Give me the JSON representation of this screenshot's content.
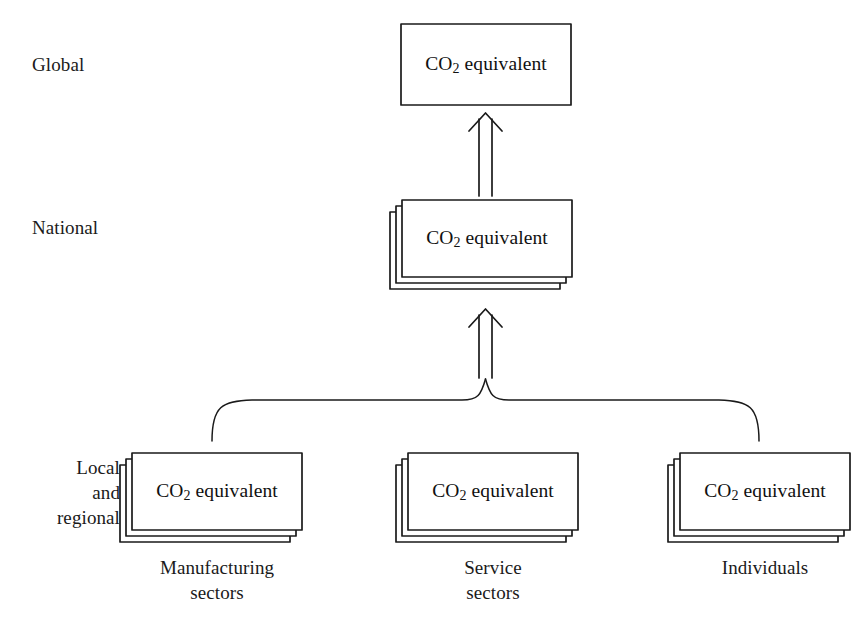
{
  "figure": {
    "kind": "hierarchy-diagram",
    "background_color": "#ffffff",
    "line_color": "#1a1a1a"
  },
  "tiers": [
    {
      "id": "global",
      "label": "Global"
    },
    {
      "id": "national",
      "label": "National"
    },
    {
      "id": "local",
      "label": "Local\nand\nregional"
    }
  ],
  "nodes": {
    "global": {
      "text_prefix": "CO",
      "text_sub": "2",
      "text_suffix": " equivalent",
      "stacked": false,
      "stack_count": 1
    },
    "national": {
      "text_prefix": "CO",
      "text_sub": "2",
      "text_suffix": " equivalent",
      "stacked": true,
      "stack_count": 3
    },
    "manufacturing": {
      "text_prefix": "CO",
      "text_sub": "2",
      "text_suffix": " equivalent",
      "stacked": true,
      "stack_count": 3,
      "caption": "Manufacturing\nsectors"
    },
    "service": {
      "text_prefix": "CO",
      "text_sub": "2",
      "text_suffix": " equivalent",
      "stacked": true,
      "stack_count": 3,
      "caption": "Service\nsectors"
    },
    "individuals": {
      "text_prefix": "CO",
      "text_sub": "2",
      "text_suffix": " equivalent",
      "stacked": true,
      "stack_count": 3,
      "caption": "Individuals"
    }
  },
  "connectors": [
    {
      "id": "national-to-global",
      "type": "hollow-arrow",
      "direction": "up"
    },
    {
      "id": "local-to-national",
      "type": "hollow-arrow",
      "direction": "up"
    },
    {
      "id": "local-brace",
      "type": "curly-brace",
      "direction": "up"
    }
  ]
}
